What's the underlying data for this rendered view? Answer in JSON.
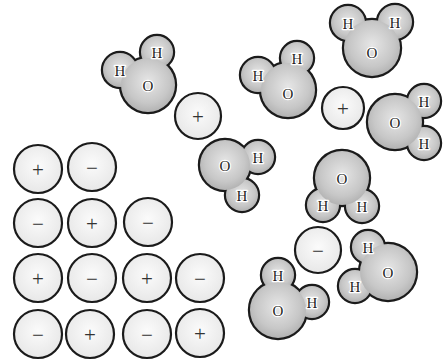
{
  "figure": {
    "width": 445,
    "height": 364,
    "background": "#ffffff",
    "outline_color": "#1b1b1b",
    "water_fill_center": "#e6e6e6",
    "water_fill_mid": "#c7c7c7",
    "water_fill_edge": "#9f9f9f",
    "ion_fill_center": "#fbfbfb",
    "ion_fill_edge": "#e2e2e2",
    "label_color": "#1f1f1f",
    "label_halo": "#ffffff",
    "sign_color": "#333333"
  },
  "labels": {
    "oxygen": "O",
    "hydrogen": "H",
    "plus": "+",
    "minus": "−"
  },
  "molecules": [
    {
      "o": {
        "x": 148,
        "y": 85,
        "r": 27
      },
      "h": [
        {
          "x": 120,
          "y": 70,
          "r": 17
        },
        {
          "x": 157,
          "y": 52,
          "r": 16
        }
      ]
    },
    {
      "o": {
        "x": 372,
        "y": 48,
        "r": 28,
        "ldy": 4
      },
      "h": [
        {
          "x": 348,
          "y": 23,
          "r": 17
        },
        {
          "x": 395,
          "y": 22,
          "r": 17
        }
      ]
    },
    {
      "o": {
        "x": 288,
        "y": 90,
        "r": 27,
        "ldy": 3
      },
      "h": [
        {
          "x": 258,
          "y": 75,
          "r": 17
        },
        {
          "x": 297,
          "y": 58,
          "r": 16
        }
      ]
    },
    {
      "o": {
        "x": 395,
        "y": 122,
        "r": 27
      },
      "h": [
        {
          "x": 424,
          "y": 101,
          "r": 16
        },
        {
          "x": 424,
          "y": 143,
          "r": 16
        }
      ]
    },
    {
      "o": {
        "x": 225,
        "y": 165,
        "r": 25
      },
      "h": [
        {
          "x": 258,
          "y": 157,
          "r": 16
        },
        {
          "x": 242,
          "y": 195,
          "r": 16
        }
      ]
    },
    {
      "o": {
        "x": 342,
        "y": 178,
        "r": 27
      },
      "h": [
        {
          "x": 323,
          "y": 205,
          "r": 16
        },
        {
          "x": 362,
          "y": 206,
          "r": 16
        }
      ]
    },
    {
      "o": {
        "x": 388,
        "y": 272,
        "r": 28
      },
      "h": [
        {
          "x": 368,
          "y": 247,
          "r": 16
        },
        {
          "x": 355,
          "y": 286,
          "r": 16
        }
      ]
    },
    {
      "o": {
        "x": 278,
        "y": 310,
        "r": 28
      },
      "h": [
        {
          "x": 278,
          "y": 275,
          "r": 16
        },
        {
          "x": 312,
          "y": 302,
          "r": 16
        }
      ]
    }
  ],
  "free_ions": [
    {
      "sign": "plus",
      "x": 198,
      "y": 116,
      "r": 23
    },
    {
      "sign": "plus",
      "x": 343,
      "y": 108,
      "r": 21
    },
    {
      "sign": "minus",
      "x": 318,
      "y": 250,
      "r": 23
    }
  ],
  "lattice_ions": [
    {
      "sign": "plus",
      "x": 38,
      "y": 169,
      "r": 24
    },
    {
      "sign": "minus",
      "x": 92,
      "y": 167,
      "r": 24
    },
    {
      "sign": "minus",
      "x": 38,
      "y": 223,
      "r": 24
    },
    {
      "sign": "plus",
      "x": 92,
      "y": 223,
      "r": 24
    },
    {
      "sign": "minus",
      "x": 148,
      "y": 222,
      "r": 24
    },
    {
      "sign": "plus",
      "x": 38,
      "y": 278,
      "r": 24
    },
    {
      "sign": "minus",
      "x": 92,
      "y": 278,
      "r": 24
    },
    {
      "sign": "plus",
      "x": 147,
      "y": 278,
      "r": 24
    },
    {
      "sign": "minus",
      "x": 200,
      "y": 278,
      "r": 24
    },
    {
      "sign": "minus",
      "x": 38,
      "y": 334,
      "r": 24
    },
    {
      "sign": "plus",
      "x": 90,
      "y": 334,
      "r": 24
    },
    {
      "sign": "minus",
      "x": 147,
      "y": 334,
      "r": 24
    },
    {
      "sign": "plus",
      "x": 200,
      "y": 333,
      "r": 24
    }
  ]
}
